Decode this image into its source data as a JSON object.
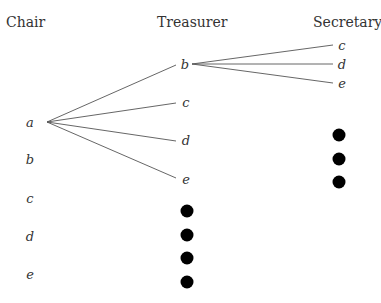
{
  "headers": {
    "chair": "Chair",
    "treasurer": "Treasurer",
    "secretary": "Secretary"
  },
  "chair": [
    "a",
    "b",
    "c",
    "d",
    "e"
  ],
  "treasurer": [
    "b",
    "c",
    "d",
    "e"
  ],
  "secretary": [
    "c",
    "d",
    "e"
  ],
  "treasurer_ellipsis_dots": 4,
  "secretary_ellipsis_dots": 3,
  "line_color": "#555555"
}
